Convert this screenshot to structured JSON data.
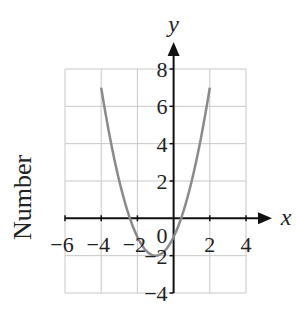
{
  "chart_data": {
    "type": "line",
    "title": "",
    "xlabel": "x",
    "ylabel": "y",
    "side_label": "Number",
    "function": "y = x^2 + 2x - 1",
    "xlim": [
      -6,
      4
    ],
    "ylim": [
      -4,
      8
    ],
    "grid": true,
    "x_ticks": [
      -6,
      -4,
      -2,
      2,
      4
    ],
    "x_tick_labels": [
      "-6",
      "-4",
      "-2",
      "2",
      "4"
    ],
    "y_ticks": [
      8,
      6,
      4,
      2,
      -2,
      -4
    ],
    "y_tick_labels": [
      "8",
      "6",
      "4",
      "2",
      "-2",
      "-4"
    ],
    "origin_label": "0",
    "series": [
      {
        "name": "parabola",
        "color": "#8a8a8a",
        "x": [
          -4,
          -3.5,
          -3,
          -2.5,
          -2,
          -1.5,
          -1,
          -0.5,
          0,
          0.5,
          1,
          1.5,
          2
        ],
        "y": [
          7,
          4.25,
          2,
          0.25,
          -1,
          -1.75,
          -2,
          -1.75,
          -1,
          0.25,
          2,
          4.25,
          7
        ]
      }
    ],
    "vertex": [
      -1,
      -2
    ]
  }
}
